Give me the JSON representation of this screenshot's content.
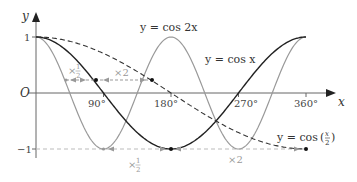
{
  "chart_data": {
    "type": "line",
    "title": "",
    "xlabel": "x",
    "ylabel": "y",
    "origin_label": "O",
    "xlim": [
      0,
      360
    ],
    "ylim": [
      -1,
      1
    ],
    "x_ticks": [
      "90°",
      "180°",
      "270°",
      "360°"
    ],
    "y_ticks": [
      "1",
      "−1"
    ],
    "series": [
      {
        "name": "y = cos 2x",
        "style": "solid grey",
        "color": "#999999"
      },
      {
        "name": "y = cos x",
        "style": "solid black",
        "color": "#222222"
      },
      {
        "name": "y = cos(x/2)",
        "style": "dashed black",
        "color": "#222222"
      }
    ],
    "annotations": [
      {
        "text": "×1/2",
        "position": "upper-left, between cos x and cos 2x"
      },
      {
        "text": "×2",
        "position": "upper, between cos x and cos(x/2)"
      },
      {
        "text": "×1/2",
        "position": "bottom, under y=-1 near 135°"
      },
      {
        "text": "×2",
        "position": "bottom, under y=-1 near 270°"
      }
    ]
  },
  "labels": {
    "y_axis": "y",
    "x_axis": "x",
    "origin": "O",
    "y1": "1",
    "ym1": "−1",
    "t90": "90°",
    "t180": "180°",
    "t270": "270°",
    "t360": "360°",
    "cos2x": "y = cos 2x",
    "cosx": "y = cos x",
    "cosx2_prefix": "y = cos",
    "half_top": "×",
    "two_top": "×2",
    "half_bottom": "×",
    "two_bottom": "×2"
  }
}
